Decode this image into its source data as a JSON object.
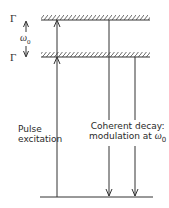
{
  "diagram": {
    "type": "energy-level-diagram",
    "levels": [
      {
        "id": "upper",
        "label": "Γ",
        "hatched": true
      },
      {
        "id": "lower-excited",
        "label": "Γ",
        "hatched": true
      },
      {
        "id": "ground",
        "label": "",
        "hatched": false
      }
    ],
    "splitting_label": {
      "symbol": "ω",
      "subscript": "0"
    },
    "transitions": [
      {
        "id": "pulse-excitation",
        "direction": "up",
        "from": "ground",
        "to": [
          "lower-excited",
          "upper"
        ],
        "label_line1": "Pulse",
        "label_line2": "excitation"
      },
      {
        "id": "decay-upper",
        "direction": "down",
        "from": "upper",
        "to": "ground"
      },
      {
        "id": "decay-lower",
        "direction": "down",
        "from": "lower-excited",
        "to": "ground"
      }
    ],
    "decay_label": {
      "line1": "Coherent decay:",
      "line2_prefix": "modulation at ",
      "symbol": "ω",
      "subscript": "0"
    },
    "colors": {
      "line": "#333333",
      "background": "#ffffff"
    }
  }
}
